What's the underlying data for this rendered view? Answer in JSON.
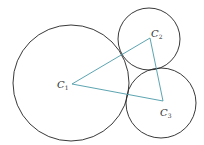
{
  "diagram": {
    "stroke_circle": "#222222",
    "stroke_triangle": "#4a9aa8",
    "circles": [
      {
        "name": "C1",
        "cx": 71,
        "cy": 83,
        "r": 58
      },
      {
        "name": "C2",
        "cx": 149,
        "cy": 39,
        "r": 31
      },
      {
        "name": "C3",
        "cx": 161,
        "cy": 103,
        "r": 35
      }
    ],
    "vertices": [
      {
        "name": "C1",
        "x": 72,
        "y": 84
      },
      {
        "name": "C2",
        "x": 150,
        "y": 38
      },
      {
        "name": "C3",
        "x": 163,
        "y": 101
      }
    ],
    "labels": [
      {
        "id": "c1",
        "main": "C",
        "sub": "1",
        "x": 57,
        "y": 88
      },
      {
        "id": "c2",
        "main": "C",
        "sub": "2",
        "x": 151,
        "y": 37
      },
      {
        "id": "c3",
        "main": "C",
        "sub": "3",
        "x": 160,
        "y": 116
      }
    ]
  }
}
